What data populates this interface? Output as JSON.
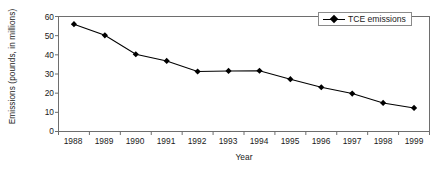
{
  "chart_data": {
    "type": "line",
    "title": "",
    "xlabel": "Year",
    "ylabel": "Emissions (pounds, in millions)",
    "categories": [
      "1988",
      "1989",
      "1990",
      "1991",
      "1992",
      "1993",
      "1994",
      "1995",
      "1996",
      "1997",
      "1998",
      "1999"
    ],
    "values": [
      56.0,
      50.2,
      40.3,
      36.8,
      31.3,
      31.6,
      31.7,
      27.3,
      23.1,
      19.8,
      14.9,
      12.3
    ],
    "series": [
      {
        "name": "TCE emissions",
        "values": [
          56.0,
          50.2,
          40.3,
          36.8,
          31.3,
          31.6,
          31.7,
          27.3,
          23.1,
          19.8,
          14.9,
          12.3
        ]
      }
    ],
    "ylim": [
      0,
      60
    ],
    "yticks": [
      "0",
      "10",
      "20",
      "30",
      "40",
      "50",
      "60"
    ],
    "xticks": [
      "1988",
      "1989",
      "1990",
      "1991",
      "1992",
      "1993",
      "1994",
      "1995",
      "1996",
      "1997",
      "1998",
      "1999"
    ],
    "grid": false,
    "legend": {
      "position": "top-right",
      "entries": [
        "TCE emissions"
      ]
    },
    "marker": "diamond",
    "line_color": "#000000",
    "marker_color": "#000000",
    "frame_color": "#6e6e6e"
  },
  "legend": {
    "label": "TCE emissions"
  },
  "axes": {
    "x_title": "Year",
    "y_title": "Emissions (pounds, in millions)"
  }
}
